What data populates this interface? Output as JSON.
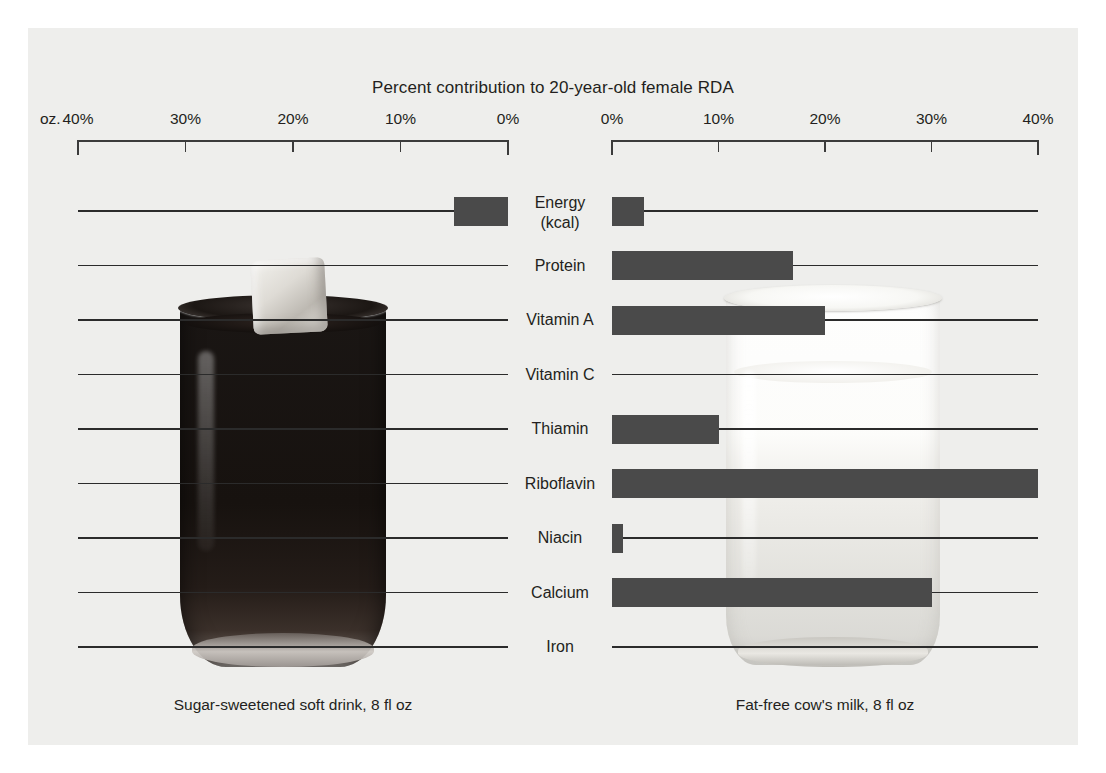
{
  "chart_data": {
    "type": "bar",
    "title": "Percent contribution to 20-year-old female RDA",
    "orientation": "horizontal-diverging",
    "unit_label": "oz.",
    "xlabel": "",
    "ylabel": "",
    "grid": false,
    "legend_position": "none",
    "categories": [
      "Energy (kcal)",
      "Protein",
      "Vitamin A",
      "Vitamin C",
      "Thiamin",
      "Riboflavin",
      "Niacin",
      "Calcium",
      "Iron"
    ],
    "category_lines": [
      [
        "Energy",
        "(kcal)"
      ],
      [
        "Protein"
      ],
      [
        "Vitamin A"
      ],
      [
        "Vitamin C"
      ],
      [
        "Thiamin"
      ],
      [
        "Riboflavin"
      ],
      [
        "Niacin"
      ],
      [
        "Calcium"
      ],
      [
        "Iron"
      ]
    ],
    "axes": [
      {
        "side": "left",
        "caption": "Sugar-sweetened soft drink, 8 fl oz",
        "ticks": [
          "40%",
          "30%",
          "20%",
          "10%",
          "0%"
        ],
        "tick_values": [
          40,
          30,
          20,
          10,
          0
        ],
        "xlim": [
          0,
          40
        ],
        "direction": "right-to-left"
      },
      {
        "side": "right",
        "caption": "Fat-free cow's milk, 8 fl oz",
        "ticks": [
          "0%",
          "10%",
          "20%",
          "30%",
          "40%"
        ],
        "tick_values": [
          0,
          10,
          20,
          30,
          40
        ],
        "xlim": [
          0,
          40
        ],
        "direction": "left-to-right"
      }
    ],
    "series": [
      {
        "name": "Sugar-sweetened soft drink, 8 fl oz",
        "side": "left",
        "values": [
          5,
          0,
          0,
          0,
          0,
          0,
          0,
          0,
          0
        ]
      },
      {
        "name": "Fat-free cow's milk, 8 fl oz",
        "side": "right",
        "values": [
          3,
          17,
          20,
          0,
          10,
          40,
          1,
          30,
          0
        ]
      }
    ],
    "colors": {
      "bar": "#4a4a4a",
      "panel_background": "#eeeeec",
      "text": "#231f20",
      "axis": "#3b3b3b"
    }
  }
}
